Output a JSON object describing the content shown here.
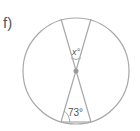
{
  "diagram": {
    "label": "f)",
    "angle_top": "x°",
    "angle_bottom": "73°",
    "colors": {
      "stroke": "#a8a8a8",
      "text": "#555555",
      "dot": "#999999"
    }
  }
}
